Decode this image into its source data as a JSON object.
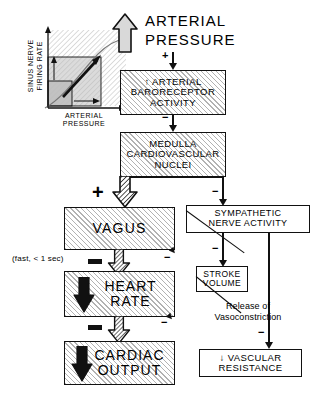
{
  "diagram": {
    "stimulus": {
      "arrow_icon": "up-arrow-icon",
      "label_line1": "ARTERIAL",
      "label_line2": "PRESSURE"
    },
    "inset_graph": {
      "name": "sinus-nerve-firing-rate-vs-arterial-pressure",
      "y_axis_label_line1": "SINUS NERVE",
      "y_axis_label_line2": "FIRING RATE",
      "x_axis_label_line1": "ARTERIAL",
      "x_axis_label_line2": "PRESSURE"
    },
    "boxes": [
      {
        "id": "baroreceptor",
        "name": "box-arterial-baroreceptor-activity",
        "arrow_glyph": "↑",
        "lines": [
          "↑ ARTERIAL",
          "BARORECEPTOR",
          "ACTIVITY"
        ],
        "fill": "hatched"
      },
      {
        "id": "medulla",
        "name": "box-medulla-cardiovascular-nuclei",
        "lines": [
          "MEDULLA",
          "CARDIOVASCULAR",
          "NUCLEI"
        ],
        "fill": "hatched"
      },
      {
        "id": "vagus",
        "name": "box-vagus",
        "lines": [
          "VAGUS"
        ],
        "fill": "hatched"
      },
      {
        "id": "heart_rate",
        "name": "box-heart-rate",
        "lines": [
          "HEART",
          "RATE"
        ],
        "fill": "hatched"
      },
      {
        "id": "cardiac_output",
        "name": "box-cardiac-output",
        "lines": [
          "CARDIAC",
          "OUTPUT"
        ],
        "fill": "hatched"
      },
      {
        "id": "sympathetic",
        "name": "box-sympathetic-nerve-activity",
        "lines": [
          "SYMPATHETIC",
          "NERVE ACTIVITY"
        ],
        "fill": "white"
      },
      {
        "id": "stroke_volume",
        "name": "box-stroke-volume",
        "lines": [
          "STROKE",
          "VOLUME"
        ],
        "fill": "white"
      },
      {
        "id": "vascular_resistance",
        "name": "box-vascular-resistance",
        "lines": [
          "↓ VASCULAR",
          "RESISTANCE"
        ],
        "fill": "white"
      }
    ],
    "annotations": {
      "speed_note": "(fast, < 1 sec)",
      "release_line1": "Release of",
      "release_line2": "Vasoconstriction"
    },
    "signs": {
      "to_baroreceptor": "+",
      "to_medulla": "−",
      "to_vagus": "+",
      "to_sympathetic": "−",
      "vagus_to_heart_rate": "−",
      "sna_to_heart_rate": "−",
      "heart_rate_to_cardiac_output": "−",
      "sv_to_cardiac_output": "−",
      "to_stroke_volume": "−",
      "to_vascular_resistance": "−"
    },
    "colors": {
      "line": "#111111",
      "hatch": "rgba(0,0,0,0.30)",
      "arrow_fill": "#d9d9d9",
      "graph_shade": "#bdbdbd",
      "background": "#ffffff"
    }
  }
}
